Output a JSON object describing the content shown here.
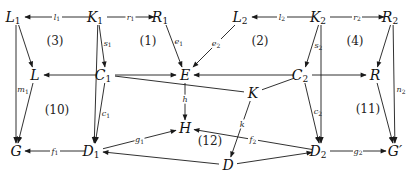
{
  "diagram": {
    "type": "commutative-diagram",
    "nodes": [
      {
        "id": "L1",
        "base": "L",
        "sub": "1"
      },
      {
        "id": "K1",
        "base": "K",
        "sub": "1"
      },
      {
        "id": "R1",
        "base": "R",
        "sub": "1"
      },
      {
        "id": "L2",
        "base": "L",
        "sub": "2"
      },
      {
        "id": "K2",
        "base": "K",
        "sub": "2"
      },
      {
        "id": "R2",
        "base": "R",
        "sub": "2"
      },
      {
        "id": "L",
        "base": "L",
        "sub": ""
      },
      {
        "id": "C1",
        "base": "C",
        "sub": "1"
      },
      {
        "id": "E",
        "base": "E",
        "sub": ""
      },
      {
        "id": "C2",
        "base": "C",
        "sub": "2"
      },
      {
        "id": "R",
        "base": "R",
        "sub": ""
      },
      {
        "id": "K",
        "base": "K",
        "sub": ""
      },
      {
        "id": "H",
        "base": "H",
        "sub": ""
      },
      {
        "id": "G",
        "base": "G",
        "sub": ""
      },
      {
        "id": "D1",
        "base": "D",
        "sub": "1"
      },
      {
        "id": "D",
        "base": "D",
        "sub": ""
      },
      {
        "id": "D2",
        "base": "D",
        "sub": "2"
      },
      {
        "id": "Gp",
        "base": "G′",
        "sub": ""
      }
    ],
    "edges": [
      {
        "from": "K1",
        "to": "L1",
        "label": "l",
        "sub": "1"
      },
      {
        "from": "K1",
        "to": "R1",
        "label": "r",
        "sub": "1"
      },
      {
        "from": "K2",
        "to": "L2",
        "label": "l",
        "sub": "2"
      },
      {
        "from": "K2",
        "to": "R2",
        "label": "r",
        "sub": "2"
      },
      {
        "from": "L1",
        "to": "L",
        "label": "",
        "sub": ""
      },
      {
        "from": "L1",
        "to": "G",
        "label": "m",
        "sub": "1"
      },
      {
        "from": "K1",
        "to": "C1",
        "label": "s",
        "sub": "1"
      },
      {
        "from": "K1",
        "to": "D1",
        "label": "",
        "sub": ""
      },
      {
        "from": "R1",
        "to": "E",
        "label": "e",
        "sub": "1"
      },
      {
        "from": "L2",
        "to": "E",
        "label": "e",
        "sub": "2"
      },
      {
        "from": "K2",
        "to": "C2",
        "label": "s",
        "sub": "2"
      },
      {
        "from": "K2",
        "to": "D2",
        "label": "",
        "sub": ""
      },
      {
        "from": "R2",
        "to": "R",
        "label": "",
        "sub": ""
      },
      {
        "from": "R2",
        "to": "Gp",
        "label": "n",
        "sub": "2"
      },
      {
        "from": "C1",
        "to": "L",
        "label": "",
        "sub": ""
      },
      {
        "from": "C1",
        "to": "E",
        "label": "",
        "sub": ""
      },
      {
        "from": "C2",
        "to": "E",
        "label": "",
        "sub": ""
      },
      {
        "from": "C2",
        "to": "R",
        "label": "",
        "sub": ""
      },
      {
        "from": "K",
        "to": "C1",
        "label": "",
        "sub": ""
      },
      {
        "from": "K",
        "to": "C2",
        "label": "",
        "sub": ""
      },
      {
        "from": "E",
        "to": "H",
        "label": "h",
        "sub": ""
      },
      {
        "from": "K",
        "to": "D",
        "label": "k",
        "sub": ""
      },
      {
        "from": "L",
        "to": "G",
        "label": "",
        "sub": ""
      },
      {
        "from": "C1",
        "to": "D1",
        "label": "c",
        "sub": "1"
      },
      {
        "from": "C2",
        "to": "D2",
        "label": "c",
        "sub": "2"
      },
      {
        "from": "R",
        "to": "Gp",
        "label": "",
        "sub": ""
      },
      {
        "from": "D1",
        "to": "G",
        "label": "f",
        "sub": "1"
      },
      {
        "from": "D1",
        "to": "H",
        "label": "g",
        "sub": "1"
      },
      {
        "from": "D2",
        "to": "H",
        "label": "f",
        "sub": "2"
      },
      {
        "from": "D2",
        "to": "Gp",
        "label": "g",
        "sub": "2"
      },
      {
        "from": "D",
        "to": "D1",
        "label": "",
        "sub": ""
      },
      {
        "from": "D",
        "to": "D2",
        "label": "",
        "sub": ""
      }
    ],
    "regions": [
      {
        "id": "r3",
        "label": "(3)"
      },
      {
        "id": "r1",
        "label": "(1)"
      },
      {
        "id": "r2",
        "label": "(2)"
      },
      {
        "id": "r4",
        "label": "(4)"
      },
      {
        "id": "r10",
        "label": "(10)"
      },
      {
        "id": "r12",
        "label": "(12)"
      },
      {
        "id": "r11",
        "label": "(11)"
      }
    ]
  }
}
